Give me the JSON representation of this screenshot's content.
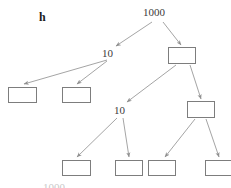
{
  "figure": {
    "panel_label": "h",
    "background_color": "#ffffff",
    "arrow_color": "#9a9a9a",
    "box_border_color": "#7d7d7d",
    "text_color": "#3b3b3b",
    "width": 231,
    "height": 188,
    "cropped_bottom_text": "1000"
  },
  "chart_data": {
    "type": "diagram",
    "title": "h",
    "nodes": [
      {
        "id": "root",
        "label": "1000",
        "kind": "text",
        "x": 155,
        "y": 12,
        "depth": 0
      },
      {
        "id": "n-l",
        "label": "10",
        "kind": "text",
        "x": 108,
        "y": 53,
        "depth": 1
      },
      {
        "id": "n-r",
        "label": "",
        "kind": "box",
        "x": 168,
        "y": 47,
        "w": 28,
        "h": 17,
        "depth": 1
      },
      {
        "id": "n-ll",
        "label": "",
        "kind": "box",
        "x": 8,
        "y": 87,
        "w": 29,
        "h": 16,
        "depth": 2
      },
      {
        "id": "n-lr",
        "label": "",
        "kind": "box",
        "x": 62,
        "y": 87,
        "w": 29,
        "h": 16,
        "depth": 2
      },
      {
        "id": "n-rl",
        "label": "10",
        "kind": "text",
        "x": 120,
        "y": 110,
        "depth": 2
      },
      {
        "id": "n-rr",
        "label": "",
        "kind": "box",
        "x": 187,
        "y": 101,
        "w": 28,
        "h": 17,
        "depth": 2
      },
      {
        "id": "n-rll",
        "label": "",
        "kind": "box",
        "x": 62,
        "y": 160,
        "w": 29,
        "h": 16,
        "depth": 3
      },
      {
        "id": "n-rlr",
        "label": "",
        "kind": "box",
        "x": 115,
        "y": 160,
        "w": 28,
        "h": 16,
        "depth": 3
      },
      {
        "id": "n-rrl",
        "label": "",
        "kind": "box",
        "x": 148,
        "y": 160,
        "w": 28,
        "h": 16,
        "depth": 3
      },
      {
        "id": "n-rrr",
        "label": "",
        "kind": "box",
        "x": 205,
        "y": 160,
        "w": 28,
        "h": 16,
        "depth": 3
      }
    ],
    "edges": [
      {
        "from": "root",
        "to": "n-l",
        "x1": 152,
        "y1": 22,
        "x2": 116,
        "y2": 46
      },
      {
        "from": "root",
        "to": "n-r",
        "x1": 163,
        "y1": 22,
        "x2": 181,
        "y2": 45
      },
      {
        "from": "n-l",
        "to": "n-ll",
        "x1": 107,
        "y1": 60,
        "x2": 24,
        "y2": 84
      },
      {
        "from": "n-l",
        "to": "n-lr",
        "x1": 107,
        "y1": 61,
        "x2": 77,
        "y2": 84
      },
      {
        "from": "n-r",
        "to": "n-rl",
        "x1": 176,
        "y1": 65,
        "x2": 127,
        "y2": 102
      },
      {
        "from": "n-r",
        "to": "n-rr",
        "x1": 190,
        "y1": 65,
        "x2": 201,
        "y2": 99
      },
      {
        "from": "n-rl",
        "to": "n-rll",
        "x1": 117,
        "y1": 118,
        "x2": 77,
        "y2": 157
      },
      {
        "from": "n-rl",
        "to": "n-rlr",
        "x1": 123,
        "y1": 118,
        "x2": 129,
        "y2": 157
      },
      {
        "from": "n-rr",
        "to": "n-rrl",
        "x1": 195,
        "y1": 119,
        "x2": 165,
        "y2": 157
      },
      {
        "from": "n-rr",
        "to": "n-rrr",
        "x1": 206,
        "y1": 119,
        "x2": 219,
        "y2": 157
      }
    ]
  },
  "labels": {
    "root_value": "1000",
    "left_branch_value": "10",
    "mid_branch_value": "10",
    "panel_letter": "h",
    "bottom_cropped": "1000"
  }
}
